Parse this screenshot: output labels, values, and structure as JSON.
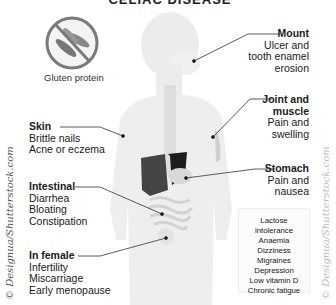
{
  "title": "CELIAC DISEASE",
  "icon": {
    "name": "gluten-protein-prohibited-icon",
    "label": "Gluten protein"
  },
  "labels": {
    "mount": {
      "heading": "Mount",
      "lines": [
        "Ulcer and",
        "tooth enamel",
        "erosion"
      ]
    },
    "joint": {
      "heading_1": "Joint and",
      "heading_2": "muscle",
      "lines": [
        "Pain and",
        "swelling"
      ]
    },
    "stomach": {
      "heading": "Stomach",
      "lines": [
        "Pain and",
        "nausea"
      ]
    },
    "skin": {
      "heading": "Skin",
      "lines": [
        "Brittle nails",
        "Acne or eczema"
      ]
    },
    "intestinal": {
      "heading": "Intestinal",
      "lines": [
        "Diarrhea",
        "Bloating",
        "Constipation"
      ]
    },
    "female": {
      "heading": "In female",
      "lines": [
        "Infertility",
        "Miscarriage",
        "Early menopause"
      ]
    }
  },
  "other_symptoms": [
    "Lactose",
    "intolerance",
    "Anaemia",
    "Dizziness",
    "Migraines",
    "Depression",
    "Low vitamin D",
    "Chronic fatigue"
  ],
  "credits": {
    "left": "© Designua/Shutterstock.com",
    "right": "© Designua/Shutterstock.com"
  },
  "colors": {
    "body": "#ececec",
    "organ_dark": "#2a2a2a",
    "line": "#333333"
  }
}
